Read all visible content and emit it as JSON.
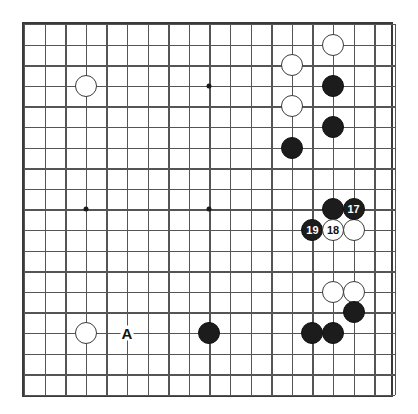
{
  "figure": {
    "kind": "go-board-diagram",
    "board_size": 19,
    "title": "",
    "colors": {
      "background": "#ffffff",
      "grid_line": "#555555",
      "border": "#3a3a3a",
      "black_stone": "#1c1c1c",
      "white_stone": "#ffffff",
      "white_stone_outline": "#3b3b3b",
      "label_on_black": "#ffffff",
      "label_on_white": "#121212",
      "board_label": "#111111"
    },
    "geometry": {
      "origin_x": 22,
      "origin_y": 22,
      "spacing": 20.6,
      "stone_diameter": 22,
      "frame_width": 371,
      "frame_height": 375
    }
  },
  "chart_data": {
    "type": "table",
    "xlabel": "",
    "ylabel": "",
    "columns": [
      "col",
      "row",
      "color",
      "label"
    ],
    "star_points": [
      {
        "col": 3,
        "row": 3
      },
      {
        "col": 9,
        "row": 3
      },
      {
        "col": 3,
        "row": 9
      },
      {
        "col": 9,
        "row": 9
      }
    ],
    "stones": [
      {
        "col": 15,
        "row": 1,
        "color": "white",
        "label": ""
      },
      {
        "col": 13,
        "row": 2,
        "color": "white",
        "label": ""
      },
      {
        "col": 3,
        "row": 3,
        "color": "white",
        "label": ""
      },
      {
        "col": 15,
        "row": 3,
        "color": "black",
        "label": ""
      },
      {
        "col": 13,
        "row": 4,
        "color": "white",
        "label": ""
      },
      {
        "col": 15,
        "row": 5,
        "color": "black",
        "label": ""
      },
      {
        "col": 13,
        "row": 6,
        "color": "black",
        "label": ""
      },
      {
        "col": 15,
        "row": 9,
        "color": "black",
        "label": ""
      },
      {
        "col": 16,
        "row": 9,
        "color": "black",
        "label": "17"
      },
      {
        "col": 14,
        "row": 10,
        "color": "black",
        "label": "19"
      },
      {
        "col": 15,
        "row": 10,
        "color": "white",
        "label": "18"
      },
      {
        "col": 16,
        "row": 10,
        "color": "white",
        "label": ""
      },
      {
        "col": 15,
        "row": 13,
        "color": "white",
        "label": ""
      },
      {
        "col": 16,
        "row": 13,
        "color": "white",
        "label": ""
      },
      {
        "col": 16,
        "row": 14,
        "color": "black",
        "label": ""
      },
      {
        "col": 3,
        "row": 15,
        "color": "white",
        "label": ""
      },
      {
        "col": 9,
        "row": 15,
        "color": "black",
        "label": ""
      },
      {
        "col": 14,
        "row": 15,
        "color": "black",
        "label": ""
      },
      {
        "col": 15,
        "row": 15,
        "color": "black",
        "label": ""
      }
    ],
    "point_labels": [
      {
        "col": 5,
        "row": 15,
        "text": "A"
      }
    ],
    "move_numbers": [
      "17",
      "18",
      "19"
    ],
    "grid": true,
    "legend": "none"
  }
}
